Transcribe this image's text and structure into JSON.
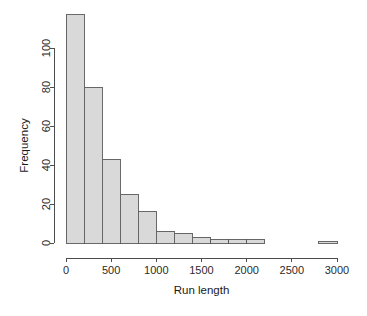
{
  "chart_data": {
    "type": "bar",
    "subtype": "histogram",
    "title": "",
    "xlabel": "Run length",
    "ylabel": "Frequency",
    "xlim": [
      0,
      3000
    ],
    "ylim": [
      0,
      117
    ],
    "bin_width": 200,
    "grid": false,
    "legend": false,
    "xticks": [
      0,
      500,
      1000,
      1500,
      2000,
      2500,
      3000
    ],
    "xtick_labels": [
      "0",
      "500",
      "1000",
      "1500",
      "2000",
      "2500",
      "3000"
    ],
    "yticks": [
      0,
      20,
      40,
      60,
      80,
      100
    ],
    "ytick_labels": [
      "0",
      "20",
      "40",
      "60",
      "80",
      "100"
    ],
    "bin_edges": [
      0,
      200,
      400,
      600,
      800,
      1000,
      1200,
      1400,
      1600,
      1800,
      2000,
      2200,
      2400,
      2600,
      2800,
      3000
    ],
    "values": [
      117,
      80,
      43,
      25,
      16,
      6,
      5,
      3,
      2,
      2,
      2,
      0,
      0,
      0,
      1
    ],
    "bars": [
      {
        "x0": 0,
        "x1": 200,
        "count": 117
      },
      {
        "x0": 200,
        "x1": 400,
        "count": 80
      },
      {
        "x0": 400,
        "x1": 600,
        "count": 43
      },
      {
        "x0": 600,
        "x1": 800,
        "count": 25
      },
      {
        "x0": 800,
        "x1": 1000,
        "count": 16
      },
      {
        "x0": 1000,
        "x1": 1200,
        "count": 6
      },
      {
        "x0": 1200,
        "x1": 1400,
        "count": 5
      },
      {
        "x0": 1400,
        "x1": 1600,
        "count": 3
      },
      {
        "x0": 1600,
        "x1": 1800,
        "count": 2
      },
      {
        "x0": 1800,
        "x1": 2000,
        "count": 2
      },
      {
        "x0": 2000,
        "x1": 2200,
        "count": 2
      },
      {
        "x0": 2200,
        "x1": 2400,
        "count": 0
      },
      {
        "x0": 2400,
        "x1": 2600,
        "count": 0
      },
      {
        "x0": 2600,
        "x1": 2800,
        "count": 0
      },
      {
        "x0": 2800,
        "x1": 3000,
        "count": 1
      }
    ],
    "colors": {
      "bar_fill": "#d9d9d9",
      "bar_stroke": "#595959",
      "axis": "#4d4d4d",
      "text": "#1a1a1a",
      "background": "#ffffff"
    }
  }
}
